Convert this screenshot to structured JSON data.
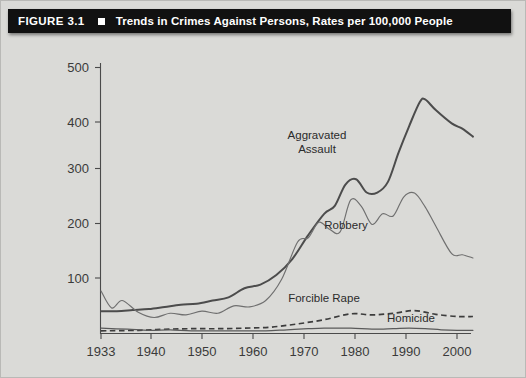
{
  "figure": {
    "label": "FIGURE 3.1",
    "marker_icon": "square-bullet-icon",
    "title": "Trends in Crimes Against Persons, Rates per 100,000 People"
  },
  "chart_data": {
    "type": "line",
    "title": "Trends in Crimes Against Persons, Rates per 100,000 People",
    "xlabel": "",
    "ylabel": "",
    "xlim": [
      1933,
      2003
    ],
    "ylim": [
      0,
      500
    ],
    "grid": false,
    "legend_position": "inline-annotations",
    "xticks": [
      1933,
      1940,
      1950,
      1960,
      1970,
      1980,
      1990,
      2000
    ],
    "xticklabels": [
      "1933",
      "1940",
      "1950",
      "1960",
      "1970",
      "1980",
      "1990",
      "2000"
    ],
    "yticks": [
      100,
      200,
      300,
      400,
      500
    ],
    "yticklabels": [
      "100",
      "200",
      "300",
      "400",
      "500"
    ],
    "annotations": [
      {
        "text": "Aggravated Assault",
        "series": "Aggravated Assault"
      },
      {
        "text": "Robbery",
        "series": "Robbery"
      },
      {
        "text": "Forcible Rape",
        "series": "Forcible Rape"
      },
      {
        "text": "Homicide",
        "series": "Homicide"
      }
    ],
    "series": [
      {
        "name": "Aggravated Assault",
        "style": "solid-thick",
        "x": [
          1933,
          1936,
          1939,
          1942,
          1945,
          1948,
          1951,
          1954,
          1957,
          1960,
          1963,
          1966,
          1969,
          1972,
          1975,
          1977,
          1979,
          1981,
          1983,
          1985,
          1987,
          1989,
          1991,
          1993,
          1994,
          1996,
          1999,
          2001,
          2003
        ],
        "values": [
          42,
          42,
          44,
          46,
          50,
          54,
          56,
          62,
          68,
          85,
          92,
          110,
          140,
          185,
          225,
          240,
          280,
          290,
          265,
          265,
          285,
          340,
          390,
          435,
          440,
          420,
          395,
          385,
          370
        ]
      },
      {
        "name": "Robbery",
        "style": "solid-thin",
        "x": [
          1933,
          1935,
          1937,
          1940,
          1943,
          1946,
          1949,
          1952,
          1955,
          1958,
          1961,
          1964,
          1967,
          1970,
          1972,
          1974,
          1976,
          1978,
          1980,
          1982,
          1984,
          1986,
          1988,
          1990,
          1992,
          1994,
          1996,
          1999,
          2001,
          2003
        ],
        "values": [
          80,
          48,
          62,
          40,
          30,
          38,
          35,
          42,
          38,
          52,
          50,
          62,
          102,
          172,
          180,
          209,
          196,
          191,
          251,
          239,
          205,
          225,
          221,
          257,
          264,
          238,
          202,
          150,
          148,
          142
        ]
      },
      {
        "name": "Forcible Rape",
        "style": "dashed",
        "x": [
          1933,
          1940,
          1945,
          1950,
          1955,
          1960,
          1965,
          1970,
          1975,
          1980,
          1984,
          1988,
          1992,
          1996,
          2000,
          2003
        ],
        "values": [
          5,
          6,
          8,
          9,
          9,
          10,
          12,
          18,
          26,
          37,
          35,
          38,
          43,
          36,
          32,
          32
        ]
      },
      {
        "name": "Homicide",
        "style": "solid-thin-low",
        "x": [
          1933,
          1938,
          1942,
          1946,
          1950,
          1955,
          1960,
          1964,
          1968,
          1972,
          1975,
          1980,
          1984,
          1988,
          1991,
          1994,
          1997,
          2000,
          2003
        ],
        "values": [
          10,
          8,
          6,
          7,
          5,
          5,
          5,
          5,
          7,
          9,
          10,
          10,
          8,
          9,
          10,
          9,
          7,
          6,
          6
        ]
      }
    ]
  }
}
